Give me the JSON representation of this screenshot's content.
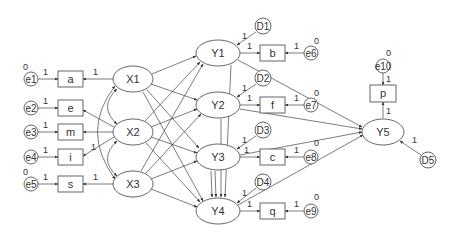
{
  "diagram": {
    "type": "structural-equation-model",
    "latent_exogenous": [
      {
        "id": "X1",
        "label": "X1",
        "cx": 133,
        "cy": 79
      },
      {
        "id": "X2",
        "label": "X2",
        "cx": 133,
        "cy": 132
      },
      {
        "id": "X3",
        "label": "X3",
        "cx": 133,
        "cy": 184
      }
    ],
    "latent_endogenous": [
      {
        "id": "Y1",
        "label": "Y1",
        "cx": 218,
        "cy": 53
      },
      {
        "id": "Y2",
        "label": "Y2",
        "cx": 218,
        "cy": 105
      },
      {
        "id": "Y3",
        "label": "Y3",
        "cx": 218,
        "cy": 157
      },
      {
        "id": "Y4",
        "label": "Y4",
        "cx": 218,
        "cy": 211
      },
      {
        "id": "Y5",
        "label": "Y5",
        "cx": 383,
        "cy": 132
      }
    ],
    "observed": [
      {
        "id": "a",
        "label": "a",
        "x": 58,
        "y": 71
      },
      {
        "id": "e",
        "label": "e",
        "x": 58,
        "y": 100
      },
      {
        "id": "m",
        "label": "m",
        "x": 58,
        "y": 124
      },
      {
        "id": "i",
        "label": "i",
        "x": 58,
        "y": 149
      },
      {
        "id": "s",
        "label": "s",
        "x": 58,
        "y": 176
      },
      {
        "id": "b",
        "label": "b",
        "x": 260,
        "y": 45
      },
      {
        "id": "f",
        "label": "f",
        "x": 260,
        "y": 97
      },
      {
        "id": "c",
        "label": "c",
        "x": 260,
        "y": 149
      },
      {
        "id": "q",
        "label": "q",
        "x": 260,
        "y": 203
      },
      {
        "id": "p",
        "label": "p",
        "x": 370,
        "y": 85
      }
    ],
    "errors": [
      {
        "id": "e1",
        "label": "e1",
        "cx": 31,
        "cy": 79,
        "variance": "0"
      },
      {
        "id": "e2",
        "label": "e2",
        "cx": 31,
        "cy": 108,
        "variance": ""
      },
      {
        "id": "e3",
        "label": "e3",
        "cx": 31,
        "cy": 132,
        "variance": ""
      },
      {
        "id": "e4",
        "label": "e4",
        "cx": 31,
        "cy": 157,
        "variance": ""
      },
      {
        "id": "e5",
        "label": "e5",
        "cx": 31,
        "cy": 184,
        "variance": "0"
      },
      {
        "id": "e6",
        "label": "e6",
        "cx": 311,
        "cy": 53,
        "variance": "0"
      },
      {
        "id": "e7",
        "label": "e7",
        "cx": 311,
        "cy": 105,
        "variance": "0"
      },
      {
        "id": "e8",
        "label": "e8",
        "cx": 311,
        "cy": 157,
        "variance": "0"
      },
      {
        "id": "e9",
        "label": "e9",
        "cx": 311,
        "cy": 211,
        "variance": "0"
      },
      {
        "id": "e10",
        "label": "e10",
        "cx": 383,
        "cy": 66,
        "variance": "0"
      }
    ],
    "disturbances": [
      {
        "id": "D1",
        "label": "D1",
        "cx": 263,
        "cy": 26
      },
      {
        "id": "D2",
        "label": "D2",
        "cx": 263,
        "cy": 78
      },
      {
        "id": "D3",
        "label": "D3",
        "cx": 263,
        "cy": 130
      },
      {
        "id": "D4",
        "label": "D4",
        "cx": 263,
        "cy": 182
      },
      {
        "id": "D5",
        "label": "D5",
        "cx": 428,
        "cy": 160
      }
    ],
    "coefficients": {
      "fixed": "1",
      "zero": "0"
    }
  }
}
